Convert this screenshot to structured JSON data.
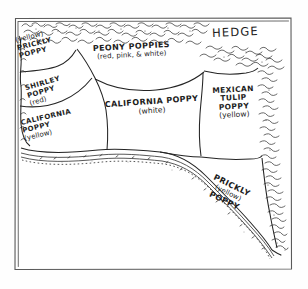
{
  "drawing": {
    "title": "Hand-drawn garden bed plan",
    "medium": "pen sketch",
    "frame": {
      "x": 14,
      "y": 17,
      "width": 278,
      "height": 253,
      "stroke_color": "#5a5a5a",
      "background_color": "#ffffff"
    },
    "ink_color": "#242424",
    "paper_color": "#fefefe"
  },
  "labels": {
    "hedge": "HEDGE",
    "prickly_poppy_nw": {
      "color_note": "(yellow)",
      "line1": "PRICKLY",
      "line2": "POPPY"
    },
    "shirley_poppy": {
      "line1": "SHIRLEY",
      "line2": "POPPY",
      "color_note": "(red)"
    },
    "california_poppy_yellow": {
      "line1": "CALIFORNIA",
      "line2": "POPPY",
      "color_note": "(yellow)"
    },
    "peony_poppies": {
      "line1": "PEONY POPPIES",
      "color_note": "(red, pink, & white)"
    },
    "california_poppy_white": {
      "line1": "CALIFORNIA POPPY",
      "color_note": "(white)"
    },
    "mexican_tulip_poppy": {
      "line1": "MEXICAN",
      "line2": "TULIP",
      "line3": "POPPY",
      "color_note": "(yellow)"
    },
    "prickly_poppy_se": {
      "line1": "PRICKLY",
      "color_note": "(yellow)",
      "line2": "POPPY"
    }
  },
  "beds": [
    {
      "name": "prickly-poppy-nw",
      "plant": "PRICKLY POPPY",
      "flower_color": "yellow"
    },
    {
      "name": "shirley-poppy",
      "plant": "SHIRLEY POPPY",
      "flower_color": "red"
    },
    {
      "name": "california-poppy-yellow",
      "plant": "CALIFORNIA POPPY",
      "flower_color": "yellow"
    },
    {
      "name": "peony-poppies",
      "plant": "PEONY POPPIES",
      "flower_color": "red, pink, & white"
    },
    {
      "name": "california-poppy-white",
      "plant": "CALIFORNIA POPPY",
      "flower_color": "white"
    },
    {
      "name": "mexican-tulip-poppy",
      "plant": "MEXICAN TULIP POPPY",
      "flower_color": "yellow"
    },
    {
      "name": "prickly-poppy-se",
      "plant": "PRICKLY POPPY",
      "flower_color": "yellow"
    }
  ],
  "features": [
    {
      "name": "hedge",
      "label": "HEDGE",
      "position": "top and right edges"
    },
    {
      "name": "garden-path",
      "label": "",
      "position": "curving along bottom and left of beds"
    }
  ]
}
